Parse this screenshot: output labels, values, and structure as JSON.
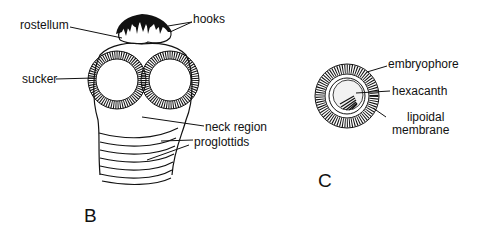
{
  "figure_b": {
    "panel_label": "B",
    "labels": {
      "rostellum": "rostellum",
      "hooks": "hooks",
      "sucker": "sucker",
      "neck_region": "neck region",
      "proglottids": "proglottids"
    }
  },
  "figure_c": {
    "panel_label": "C",
    "labels": {
      "embryophore": "embryophore",
      "hexacanth": "hexacanth",
      "lipoidal_membrane_line1": "lipoidal",
      "lipoidal_membrane_line2": "membrane"
    }
  },
  "colors": {
    "ink": "#111111",
    "background": "#ffffff"
  }
}
